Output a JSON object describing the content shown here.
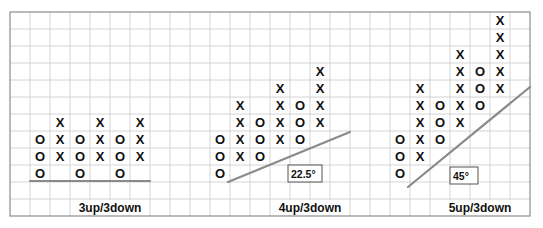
{
  "grid": {
    "left": 10,
    "top": 12,
    "col_width": 20,
    "row_height": 17,
    "columns": 26,
    "rows": 12,
    "grid_color": "#d4d4d4",
    "border_color": "#8c8c8c"
  },
  "colors": {
    "symbol": "#111111",
    "trendline": "#8a8a8a",
    "label_box_border": "#555555"
  },
  "chart_data": {
    "type": "point-and-figure",
    "title": "",
    "panels": [
      {
        "label": "3up/3down",
        "label_center_col": 5,
        "columns": [
          {
            "col": 1,
            "symbol": "O",
            "rows": [
              7,
              8,
              9
            ]
          },
          {
            "col": 2,
            "symbol": "X",
            "rows": [
              6,
              7,
              8
            ]
          },
          {
            "col": 3,
            "symbol": "O",
            "rows": [
              7,
              8,
              9
            ]
          },
          {
            "col": 4,
            "symbol": "X",
            "rows": [
              6,
              7,
              8
            ]
          },
          {
            "col": 5,
            "symbol": "O",
            "rows": [
              7,
              8,
              9
            ]
          },
          {
            "col": 6,
            "symbol": "X",
            "rows": [
              6,
              7,
              8
            ]
          }
        ],
        "trendline": {
          "x1": 30,
          "y1": 181,
          "x2": 150,
          "y2": 181
        },
        "angle_label": null
      },
      {
        "label": "4up/3down",
        "label_center_col": 15,
        "columns": [
          {
            "col": 10,
            "symbol": "O",
            "rows": [
              7,
              8,
              9
            ]
          },
          {
            "col": 11,
            "symbol": "X",
            "rows": [
              5,
              6,
              7,
              8
            ]
          },
          {
            "col": 12,
            "symbol": "O",
            "rows": [
              6,
              7,
              8
            ]
          },
          {
            "col": 13,
            "symbol": "X",
            "rows": [
              4,
              5,
              6,
              7
            ]
          },
          {
            "col": 14,
            "symbol": "O",
            "rows": [
              5,
              6,
              7
            ]
          },
          {
            "col": 15,
            "symbol": "X",
            "rows": [
              3,
              4,
              5,
              6
            ]
          }
        ],
        "trendline": {
          "x1": 228,
          "y1": 182,
          "x2": 350,
          "y2": 132
        },
        "angle_label": {
          "text": "22.5°",
          "x": 288,
          "y": 165,
          "w": 34,
          "h": 17
        }
      },
      {
        "label": "5up/3down",
        "label_center_col": 23.5,
        "columns": [
          {
            "col": 19,
            "symbol": "O",
            "rows": [
              7,
              8,
              9
            ]
          },
          {
            "col": 20,
            "symbol": "X",
            "rows": [
              4,
              5,
              6,
              7,
              8
            ]
          },
          {
            "col": 21,
            "symbol": "O",
            "rows": [
              5,
              6,
              7
            ]
          },
          {
            "col": 22,
            "symbol": "X",
            "rows": [
              2,
              3,
              4,
              5,
              6
            ]
          },
          {
            "col": 23,
            "symbol": "O",
            "rows": [
              3,
              4,
              5
            ]
          },
          {
            "col": 24,
            "symbol": "X",
            "rows": [
              0,
              1,
              2,
              3,
              4
            ]
          }
        ],
        "trendline": {
          "x1": 408,
          "y1": 187,
          "x2": 530,
          "y2": 87
        },
        "angle_label": {
          "text": "45°",
          "x": 450,
          "y": 167,
          "w": 28,
          "h": 17
        }
      }
    ],
    "label_row": 11
  }
}
